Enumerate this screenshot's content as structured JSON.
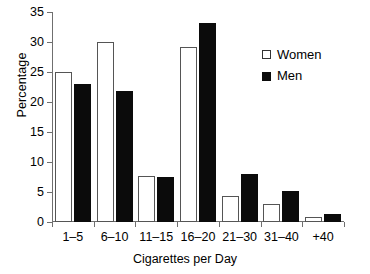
{
  "chart_data": {
    "type": "bar",
    "title": "",
    "xlabel": "Cigarettes per Day",
    "ylabel": "Percentage",
    "categories": [
      "1–5",
      "6–10",
      "11–15",
      "16–20",
      "21–30",
      "31–40",
      "+40"
    ],
    "series": [
      {
        "name": "Women",
        "color": "#ffffff",
        "values": [
          25.0,
          30.0,
          7.7,
          29.2,
          4.4,
          3.0,
          0.8
        ]
      },
      {
        "name": "Men",
        "color": "#000000",
        "values": [
          23.0,
          21.8,
          7.5,
          33.2,
          8.0,
          5.2,
          1.4
        ]
      }
    ],
    "ylim": [
      0,
      35
    ],
    "yticks": [
      0,
      5,
      10,
      15,
      20,
      25,
      30,
      35
    ],
    "ytick_labels": [
      "0",
      "5",
      "10",
      "15",
      "20",
      "25",
      "30",
      "35"
    ],
    "grid": false,
    "legend_position": "top-right"
  },
  "legend": {
    "items": [
      {
        "label": "Women",
        "marker": "open-square"
      },
      {
        "label": "Men",
        "marker": "filled-square"
      }
    ]
  }
}
